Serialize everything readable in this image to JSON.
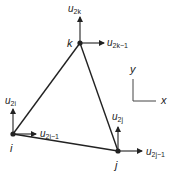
{
  "diagram": {
    "type": "triangular-finite-element",
    "nodes": [
      {
        "id": "i",
        "label": "i",
        "x": 13,
        "y": 134,
        "dofs": {
          "vertical": {
            "base": "u",
            "sub": "2i"
          },
          "horizontal": {
            "base": "u",
            "sub": "2i−1"
          }
        }
      },
      {
        "id": "j",
        "label": "j",
        "x": 118,
        "y": 151,
        "dofs": {
          "vertical": {
            "base": "u",
            "sub": "2j"
          },
          "horizontal": {
            "base": "u",
            "sub": "2j−1"
          }
        }
      },
      {
        "id": "k",
        "label": "k",
        "x": 80,
        "y": 43,
        "dofs": {
          "vertical": {
            "base": "u",
            "sub": "2k"
          },
          "horizontal": {
            "base": "u",
            "sub": "2k−1"
          }
        }
      }
    ],
    "edges": [
      [
        "i",
        "j"
      ],
      [
        "j",
        "k"
      ],
      [
        "k",
        "i"
      ]
    ],
    "axes": {
      "x_label": "x",
      "y_label": "y"
    },
    "colors": {
      "stroke": "#222222",
      "background": "#ffffff"
    }
  }
}
